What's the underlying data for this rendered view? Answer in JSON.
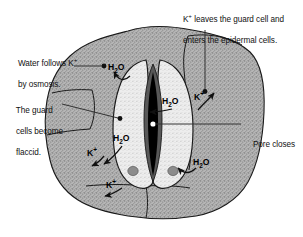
{
  "figure": {
    "background_color": "#ffffff",
    "line_color": "#1a1a1a"
  },
  "colors": {
    "epidermal_fill": "#b4b4b4",
    "guard_cell_fill": "#ececec",
    "pore_rim_fill": "#585858",
    "pore_fill": "#000000",
    "nucleus_fill": "#8c8c8c",
    "center_dot": "#ffffff",
    "text": "#111111"
  },
  "annotations": {
    "top_right": {
      "line1": "K+ leaves the guard cell and",
      "line2": "enters the epidermal cells.",
      "leader": "vertical-line-down-to-k-dot"
    },
    "water_osmosis": {
      "line1": "Water follows K+",
      "line2": "by osmosis.",
      "leader": "horizontal-line-right-to-dot"
    },
    "guard_flaccid": {
      "line1": "The guard",
      "line2": "cells become",
      "line3": "flaccid.",
      "leader": "horizontal-line-right-to-dot"
    },
    "pore_closes": {
      "line1": "Pore closes",
      "leader": "horizontal-line-left-to-center-dot"
    }
  },
  "chem_labels": [
    {
      "id": "h2o-top-left",
      "formula": "H2O",
      "arrow": "curve-left-up"
    },
    {
      "id": "h2o-middle",
      "formula": "H2O",
      "arrow": "line-left"
    },
    {
      "id": "h2o-lower-left",
      "formula": "H2O",
      "arrow": "curve-left-down"
    },
    {
      "id": "h2o-bottom-right",
      "formula": "H2O",
      "arrow": "curve-left-down"
    },
    {
      "id": "k-right",
      "formula": "K+",
      "arrow": "curve-right-up"
    },
    {
      "id": "k-left-upper",
      "formula": "K+",
      "arrow": "curve-left-down"
    },
    {
      "id": "k-left-lower",
      "formula": "K+",
      "arrow": "curve-left-down"
    }
  ],
  "structures": {
    "epidermal_cells": "surrounding stippled gray epidermal cells",
    "guard_cells": "two light stippled kidney-shaped guard cells",
    "pore": "narrow closed black lens-shaped stomatal pore",
    "nuclei": "two gray nuclei, one in each guard cell",
    "center_marker": "white dot at pore center"
  }
}
